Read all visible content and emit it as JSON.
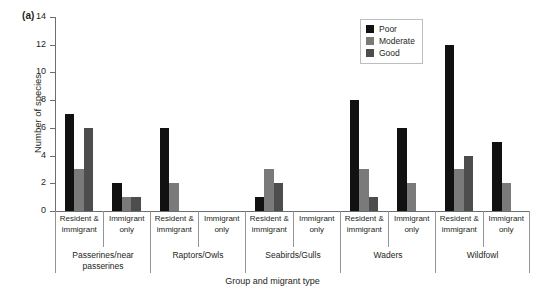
{
  "panel": {
    "label": "(a)"
  },
  "chart_data": {
    "type": "bar",
    "title": "",
    "xlabel": "Group and migrant type",
    "ylabel": "Number of species",
    "ylim": [
      0,
      14
    ],
    "yticks": [
      0,
      2,
      4,
      6,
      8,
      10,
      12,
      14
    ],
    "grid": false,
    "legend_position": "top-right",
    "groups": [
      "Passerines/near passerines",
      "Raptors/Owls",
      "Seabirds/Gulls",
      "Waders",
      "Wildfowl"
    ],
    "subcategories": [
      "Resident & immigrant",
      "Immigrant only"
    ],
    "categories": [
      "Resident & immigrant",
      "Immigrant only",
      "Resident & immigrant",
      "Immigrant only",
      "Resident & immigrant",
      "Immigrant only",
      "Resident & immigrant",
      "Immigrant only",
      "Resident & immigrant",
      "Immigrant only"
    ],
    "series": [
      {
        "name": "Poor",
        "color": "#111111",
        "values": [
          7,
          2,
          6,
          0,
          1,
          0,
          8,
          6,
          12,
          5
        ]
      },
      {
        "name": "Moderate",
        "color": "#7a7a7a",
        "values": [
          3,
          1,
          2,
          0,
          3,
          0,
          3,
          2,
          3,
          2
        ]
      },
      {
        "name": "Good",
        "color": "#4d4d4d",
        "values": [
          6,
          1,
          0,
          0,
          2,
          0,
          1,
          0,
          4,
          0
        ]
      }
    ]
  },
  "axis": {
    "y_tick_labels": [
      "0",
      "2",
      "4",
      "6",
      "8",
      "10",
      "12",
      "14"
    ],
    "y_title": "Number of species",
    "x_title": "Group and migrant type"
  },
  "legend": {
    "items": [
      {
        "label": "Poor",
        "color": "#111111"
      },
      {
        "label": "Moderate",
        "color": "#7a7a7a"
      },
      {
        "label": "Good",
        "color": "#4d4d4d"
      }
    ]
  },
  "groups_row": [
    {
      "label": "Passerines/near passerines",
      "span": 2
    },
    {
      "label": "Raptors/Owls",
      "span": 2
    },
    {
      "label": "Seabirds/Gulls",
      "span": 2
    },
    {
      "label": "Waders",
      "span": 2
    },
    {
      "label": "Wildfowl",
      "span": 2
    }
  ],
  "subcat_row": [
    {
      "label": "Resident & immigrant"
    },
    {
      "label": "Immigrant only"
    },
    {
      "label": "Resident & immigrant"
    },
    {
      "label": "Immigrant only"
    },
    {
      "label": "Resident & immigrant"
    },
    {
      "label": "Immigrant only"
    },
    {
      "label": "Resident & immigrant"
    },
    {
      "label": "Immigrant only"
    },
    {
      "label": "Resident & immigrant"
    },
    {
      "label": "Immigrant only"
    }
  ]
}
